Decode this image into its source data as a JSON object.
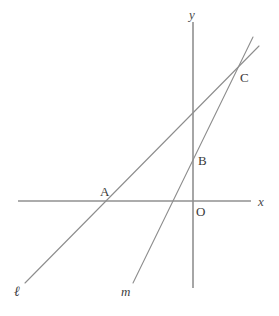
{
  "figure": {
    "kind": "coordinate-geometry-diagram",
    "width": 279,
    "height": 316,
    "background_color": "#ffffff"
  },
  "axes": {
    "color": "#909090",
    "stroke_width": 1.6,
    "x_axis": {
      "label": "x",
      "label_x": 258,
      "label_y": 195,
      "x1": 18,
      "y1": 201,
      "x2": 251,
      "y2": 201
    },
    "y_axis": {
      "label": "y",
      "label_x": 189,
      "label_y": 8,
      "x1": 193,
      "y1": 22,
      "x2": 193,
      "y2": 288
    },
    "origin_label": {
      "text": "O",
      "x": 196,
      "y": 205
    }
  },
  "lines": [
    {
      "id": "line-l",
      "label": "ℓ",
      "label_x": 14,
      "label_y": 285,
      "color": "#8d8d8d",
      "stroke_width": 1.1,
      "x1": 25,
      "y1": 283,
      "x2": 259,
      "y2": 46
    },
    {
      "id": "line-m",
      "label": "m",
      "label_x": 121,
      "label_y": 285,
      "color": "#8d8d8d",
      "stroke_width": 1.1,
      "x1": 133,
      "y1": 283,
      "x2": 253,
      "y2": 37
    }
  ],
  "points": [
    {
      "id": "point-a",
      "label": "A",
      "label_x": 100,
      "label_y": 185,
      "at_x": 112,
      "at_y": 201,
      "description": "intersection of line l with x-axis"
    },
    {
      "id": "point-b",
      "label": "B",
      "label_x": 198,
      "label_y": 154,
      "at_x": 193,
      "at_y": 156,
      "description": "intersection of line l with y-axis"
    },
    {
      "id": "point-c",
      "label": "C",
      "label_x": 240,
      "label_y": 71,
      "at_x": 234,
      "at_y": 73,
      "description": "intersection of line l and line m"
    }
  ]
}
